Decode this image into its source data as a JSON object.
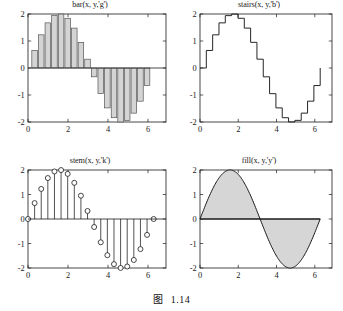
{
  "figure": {
    "caption_label": "图",
    "caption_number": "1.14",
    "background": "#ffffff"
  },
  "chart_data": [
    {
      "type": "bar",
      "title": "bar(x, y,'g')",
      "panel": "top-left",
      "xlabel": "",
      "ylabel": "",
      "xlim": [
        0,
        6.9
      ],
      "ylim": [
        -2,
        2
      ],
      "xticks": [
        0,
        2,
        4,
        6
      ],
      "xticklabels": [
        "0",
        "2",
        "4",
        "6"
      ],
      "yticks": [
        -2,
        -1,
        0,
        1,
        2
      ],
      "yticklabels": [
        "-2",
        "-1",
        "0",
        "1",
        "2"
      ],
      "grid": false,
      "expression": "y = 2*sin(x)",
      "bar_facecolor": "#d4d4d4",
      "bar_edgecolor": "#4a4a4a",
      "x": [
        0.0,
        0.3307,
        0.6614,
        0.9921,
        1.3228,
        1.6535,
        1.9842,
        2.3149,
        2.6456,
        2.9763,
        3.307,
        3.6377,
        3.9684,
        4.2991,
        4.6298,
        4.9605,
        5.2912,
        5.6219,
        5.9526,
        6.2832
      ],
      "values": [
        0.0,
        0.6498,
        1.2283,
        1.6718,
        1.9395,
        1.9979,
        1.8415,
        1.4776,
        0.9506,
        0.3266,
        -0.3266,
        -0.9506,
        -1.4776,
        -1.8415,
        -1.9979,
        -1.9395,
        -1.6718,
        -1.2283,
        -0.6498,
        0.0
      ]
    },
    {
      "type": "line",
      "title": "stairs(x, y,'b')",
      "panel": "top-right",
      "style": "stairs",
      "xlabel": "",
      "ylabel": "",
      "xlim": [
        0,
        6.9
      ],
      "ylim": [
        -2,
        2
      ],
      "xticks": [
        0,
        2,
        4,
        6
      ],
      "xticklabels": [
        "0",
        "2",
        "4",
        "6"
      ],
      "yticks": [
        -2,
        -1,
        0,
        1,
        2
      ],
      "yticklabels": [
        "-2",
        "-1",
        "0",
        "1",
        "2"
      ],
      "grid": false,
      "expression": "y = 2*sin(x)",
      "linecolor": "#1a1a1a",
      "x": [
        0.0,
        0.3307,
        0.6614,
        0.9921,
        1.3228,
        1.6535,
        1.9842,
        2.3149,
        2.6456,
        2.9763,
        3.307,
        3.6377,
        3.9684,
        4.2991,
        4.6298,
        4.9605,
        5.2912,
        5.6219,
        5.9526,
        6.2832
      ],
      "values": [
        0.0,
        0.6498,
        1.2283,
        1.6718,
        1.9395,
        1.9979,
        1.8415,
        1.4776,
        0.9506,
        0.3266,
        -0.3266,
        -0.9506,
        -1.4776,
        -1.8415,
        -1.9979,
        -1.9395,
        -1.6718,
        -1.2283,
        -0.6498,
        0.0
      ]
    },
    {
      "type": "scatter",
      "title": "stem(x, y,'k')",
      "panel": "bottom-left",
      "style": "stem",
      "xlabel": "",
      "ylabel": "",
      "xlim": [
        0,
        6.9
      ],
      "ylim": [
        -2,
        2
      ],
      "xticks": [
        0,
        2,
        4,
        6
      ],
      "xticklabels": [
        "0",
        "2",
        "4",
        "6"
      ],
      "yticks": [
        -2,
        -1,
        0,
        1,
        2
      ],
      "yticklabels": [
        "-2",
        "-1",
        "0",
        "1",
        "2"
      ],
      "grid": false,
      "expression": "y = 2*sin(x)",
      "markercolor": "#1a1a1a",
      "marker": "circle",
      "x": [
        0.0,
        0.3307,
        0.6614,
        0.9921,
        1.3228,
        1.6535,
        1.9842,
        2.3149,
        2.6456,
        2.9763,
        3.307,
        3.6377,
        3.9684,
        4.2991,
        4.6298,
        4.9605,
        5.2912,
        5.6219,
        5.9526,
        6.2832
      ],
      "values": [
        0.0,
        0.6498,
        1.2283,
        1.6718,
        1.9395,
        1.9979,
        1.8415,
        1.4776,
        0.9506,
        0.3266,
        -0.3266,
        -0.9506,
        -1.4776,
        -1.8415,
        -1.9979,
        -1.9395,
        -1.6718,
        -1.2283,
        -0.6498,
        0.0
      ]
    },
    {
      "type": "area",
      "title": "fill(x, y,'y')",
      "panel": "bottom-right",
      "style": "fill",
      "xlabel": "",
      "ylabel": "",
      "xlim": [
        0,
        6.9
      ],
      "ylim": [
        -2,
        2
      ],
      "xticks": [
        0,
        2,
        4,
        6
      ],
      "xticklabels": [
        "0",
        "2",
        "4",
        "6"
      ],
      "yticks": [
        -2,
        -1,
        0,
        1,
        2
      ],
      "yticklabels": [
        "-2",
        "-1",
        "0",
        "1",
        "2"
      ],
      "grid": false,
      "expression": "y = 2*sin(x)",
      "fillcolor": "#d6d6d6",
      "edgecolor": "#1a1a1a",
      "x": [
        0.0,
        0.3307,
        0.6614,
        0.9921,
        1.3228,
        1.6535,
        1.9842,
        2.3149,
        2.6456,
        2.9763,
        3.307,
        3.6377,
        3.9684,
        4.2991,
        4.6298,
        4.9605,
        5.2912,
        5.6219,
        5.9526,
        6.2832
      ],
      "values": [
        0.0,
        0.6498,
        1.2283,
        1.6718,
        1.9395,
        1.9979,
        1.8415,
        1.4776,
        0.9506,
        0.3266,
        -0.3266,
        -0.9506,
        -1.4776,
        -1.8415,
        -1.9979,
        -1.9395,
        -1.6718,
        -1.2283,
        -0.6498,
        0.0
      ]
    }
  ]
}
